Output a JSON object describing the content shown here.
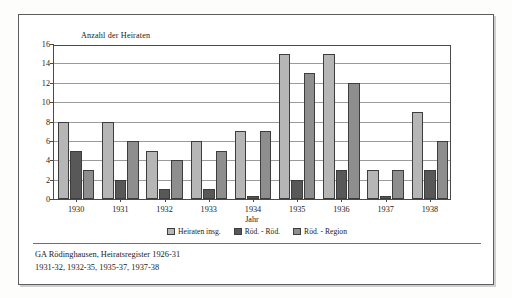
{
  "document": {
    "footer_lines": [
      "GA Rödinghausen, Heiratsregister 1926-31",
      "1931-32, 1932-35, 1935-37, 1937-38"
    ]
  },
  "colors": {
    "series_total": "#b6b6b6",
    "series_local": "#585858",
    "series_region": "#8e8e8e",
    "axis": "#4a4a4a",
    "grid": "#9b9b9b",
    "frame": "#5d5d5d",
    "background": "#ffffff"
  },
  "chart_data": {
    "type": "bar",
    "title": "",
    "xlabel": "Jahr",
    "ylabel": "Anzahl der Heiraten",
    "categories": [
      "1930",
      "1931",
      "1932",
      "1933",
      "1934",
      "1935",
      "1936",
      "1937",
      "1938"
    ],
    "series": [
      {
        "name": "Heiraten insg.",
        "values": [
          8,
          8,
          5,
          6,
          7,
          15,
          15,
          3,
          9
        ]
      },
      {
        "name": "Röd. - Röd.",
        "values": [
          5,
          2,
          1,
          1,
          0.3,
          2,
          3,
          0.3,
          3
        ]
      },
      {
        "name": "Röd. - Region",
        "values": [
          3,
          6,
          4,
          5,
          7,
          13,
          12,
          3,
          6
        ]
      }
    ],
    "ylim": [
      0,
      16
    ],
    "yticks": [
      0,
      2,
      4,
      6,
      8,
      10,
      12,
      14,
      16
    ],
    "grid": true,
    "legend_position": "bottom"
  }
}
